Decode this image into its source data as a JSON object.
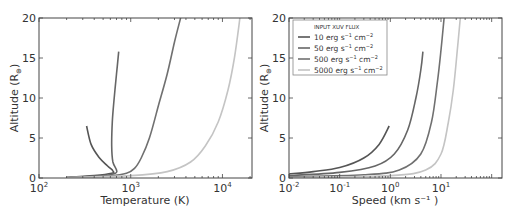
{
  "chart_data": [
    {
      "type": "line",
      "title": "",
      "xlabel": "Temperature (K)",
      "ylabel": "Altitude (R⊕)",
      "xscale": "log",
      "xlim": [
        100,
        21000
      ],
      "ylim": [
        0,
        20
      ],
      "xticks": [
        {
          "value": 100,
          "label": "10",
          "exp": "2"
        },
        {
          "value": 1000,
          "label": "10",
          "exp": "3"
        },
        {
          "value": 10000,
          "label": "10",
          "exp": "4"
        }
      ],
      "yticks": [
        "0",
        "5",
        "10",
        "15",
        "20"
      ],
      "grid": false,
      "series": [
        {
          "name": "10 erg s⁻¹ cm⁻²",
          "color": "#555555",
          "points": [
            [
              200,
              0.05
            ],
            [
              400,
              0.3
            ],
            [
              620,
              0.6
            ],
            [
              640,
              0.9
            ],
            [
              560,
              1.5
            ],
            [
              450,
              2.6
            ],
            [
              370,
              4.2
            ],
            [
              330,
              6.5
            ]
          ]
        },
        {
          "name": "50 erg s⁻¹ cm⁻²",
          "color": "#666666",
          "points": [
            [
              200,
              0.05
            ],
            [
              500,
              0.3
            ],
            [
              680,
              0.6
            ],
            [
              700,
              1.0
            ],
            [
              640,
              2.0
            ],
            [
              620,
              4.0
            ],
            [
              630,
              7
            ],
            [
              660,
              10
            ],
            [
              700,
              13
            ],
            [
              740,
              15.8
            ]
          ]
        },
        {
          "name": "500 erg s⁻¹ cm⁻²",
          "color": "#707070",
          "points": [
            [
              200,
              0.05
            ],
            [
              600,
              0.3
            ],
            [
              900,
              0.6
            ],
            [
              1100,
              1.2
            ],
            [
              1300,
              2.5
            ],
            [
              1600,
              5
            ],
            [
              2000,
              9
            ],
            [
              2500,
              13
            ],
            [
              3000,
              17
            ],
            [
              3500,
              20
            ]
          ]
        },
        {
          "name": "5000 erg s⁻¹ cm⁻²",
          "color": "#c4c4c4",
          "points": [
            [
              200,
              0.05
            ],
            [
              1000,
              0.3
            ],
            [
              2500,
              0.8
            ],
            [
              4500,
              2
            ],
            [
              6500,
              4
            ],
            [
              9000,
              7
            ],
            [
              11500,
              11
            ],
            [
              13500,
              15
            ],
            [
              15500,
              20
            ]
          ]
        }
      ]
    },
    {
      "type": "line",
      "title": "",
      "xlabel": "Speed (km s⁻¹)",
      "ylabel": "Altitude (R⊕)",
      "xscale": "log",
      "xlim": [
        0.01,
        160
      ],
      "ylim": [
        0,
        20
      ],
      "xticks": [
        {
          "value": 0.01,
          "label": "10",
          "exp": "-2"
        },
        {
          "value": 0.1,
          "label": "10",
          "exp": "-1"
        },
        {
          "value": 1,
          "label": "10",
          "exp": "0"
        },
        {
          "value": 10,
          "label": "10",
          "exp": "1"
        }
      ],
      "yticks": [
        "0",
        "5",
        "10",
        "15",
        "20"
      ],
      "grid": false,
      "legend": {
        "title": "INPUT XUV FLUX",
        "position": "upper left"
      },
      "series": [
        {
          "name": "10 erg s⁻¹ cm⁻²",
          "color": "#555555",
          "points": [
            [
              0.01,
              0.5
            ],
            [
              0.03,
              0.8
            ],
            [
              0.1,
              1.3
            ],
            [
              0.3,
              2.5
            ],
            [
              0.6,
              4.2
            ],
            [
              0.95,
              6.5
            ]
          ]
        },
        {
          "name": "50 erg s⁻¹ cm⁻²",
          "color": "#666666",
          "points": [
            [
              0.01,
              0.3
            ],
            [
              0.1,
              0.7
            ],
            [
              0.5,
              1.5
            ],
            [
              1.2,
              3
            ],
            [
              2.2,
              6
            ],
            [
              3.2,
              10
            ],
            [
              4.0,
              13.5
            ],
            [
              4.4,
              15.8
            ]
          ]
        },
        {
          "name": "500 erg s⁻¹ cm⁻²",
          "color": "#707070",
          "points": [
            [
              0.01,
              0.15
            ],
            [
              0.3,
              0.4
            ],
            [
              1.5,
              1
            ],
            [
              4,
              3
            ],
            [
              6.5,
              7
            ],
            [
              8.5,
              12
            ],
            [
              10,
              16
            ],
            [
              11.5,
              20
            ]
          ]
        },
        {
          "name": "5000 erg s⁻¹ cm⁻²",
          "color": "#c4c4c4",
          "points": [
            [
              0.01,
              0.05
            ],
            [
              1,
              0.3
            ],
            [
              5,
              1
            ],
            [
              10,
              3
            ],
            [
              14,
              7
            ],
            [
              17.5,
              11
            ],
            [
              21,
              16
            ],
            [
              24,
              20
            ]
          ]
        }
      ]
    }
  ],
  "legend": {
    "title": "INPUT XUV FLUX",
    "entries": [
      {
        "value": "10",
        "unit": "erg s",
        "exp1": "−1",
        "unit2": "cm",
        "exp2": "−2",
        "color": "#555555"
      },
      {
        "value": "50",
        "unit": "erg s",
        "exp1": "−1",
        "unit2": "cm",
        "exp2": "−2",
        "color": "#666666"
      },
      {
        "value": "500",
        "unit": "erg s",
        "exp1": "−1",
        "unit2": "cm",
        "exp2": "−2",
        "color": "#707070"
      },
      {
        "value": "5000",
        "unit": "erg s",
        "exp1": "−1",
        "unit2": "cm",
        "exp2": "−2",
        "color": "#c4c4c4"
      }
    ]
  },
  "labels": {
    "left_xlabel": "Temperature (K)",
    "right_xlabel": "Speed (km s⁻¹ )",
    "ylabel": "Altitude (R",
    "ylabel_sub": "⊕",
    "ylabel_end": ")"
  }
}
